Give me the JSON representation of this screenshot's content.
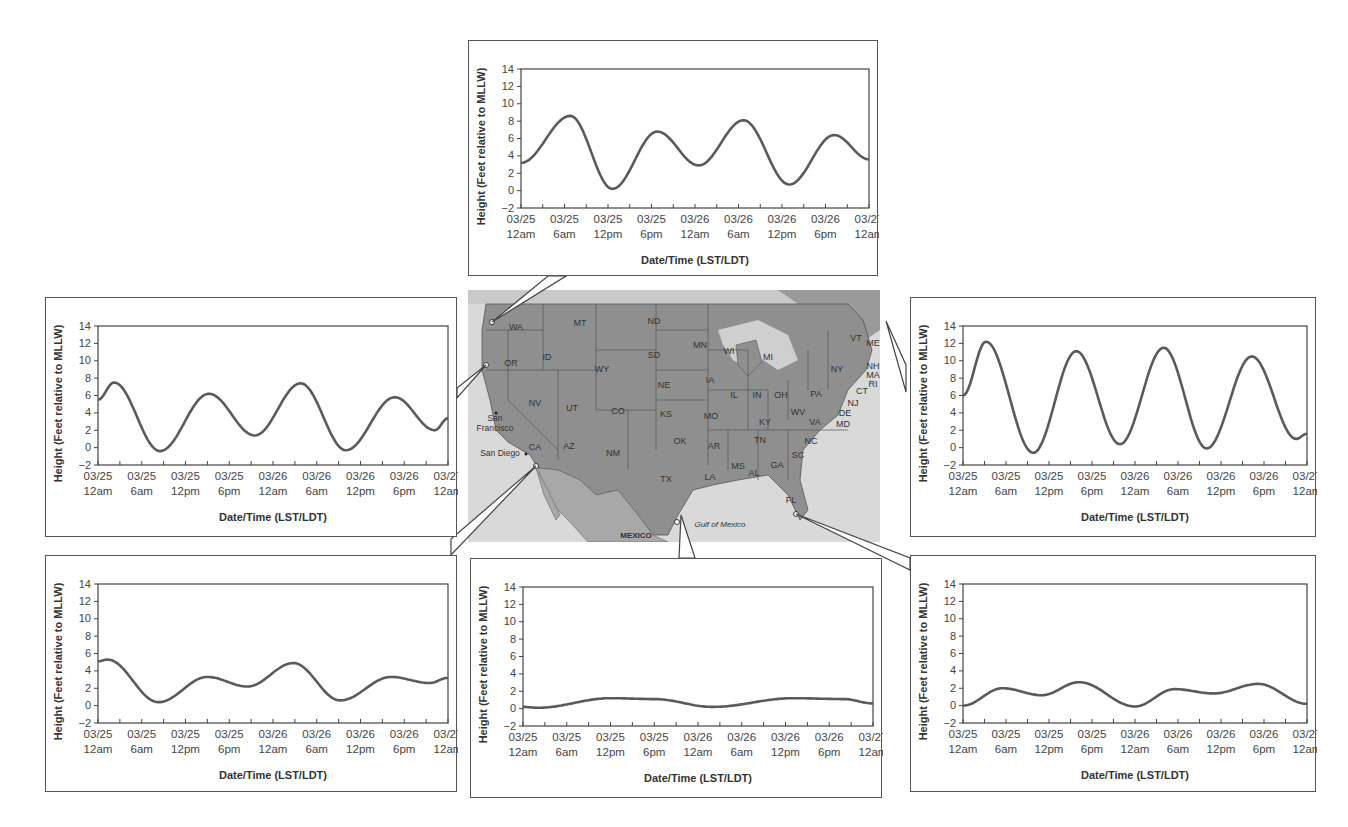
{
  "axis": {
    "ylabel": "Height (Feet relative to MLLW)",
    "xlabel": "Date/Time (LST/LDT)",
    "yticks": [
      14,
      12,
      10,
      8,
      6,
      4,
      2,
      0,
      -2
    ],
    "xticks_top": [
      "03/25",
      "03/25",
      "03/25",
      "03/25",
      "03/26",
      "03/26",
      "03/26",
      "03/26",
      "03/27"
    ],
    "xticks_bottom": [
      "12am",
      "6am",
      "12pm",
      "6pm",
      "12am",
      "6am",
      "12pm",
      "6pm",
      "12am"
    ]
  },
  "map": {
    "labels": {
      "WA": "WA",
      "OR": "OR",
      "ID": "ID",
      "MT": "MT",
      "ND": "ND",
      "SD": "SD",
      "WY": "WY",
      "NE": "NE",
      "NV": "NV",
      "UT": "UT",
      "CO": "CO",
      "KS": "KS",
      "CA": "CA",
      "AZ": "AZ",
      "NM": "NM",
      "OK": "OK",
      "TX": "TX",
      "MN": "MN",
      "IA": "IA",
      "MO": "MO",
      "AR": "AR",
      "LA": "LA",
      "WI": "WI",
      "IL": "IL",
      "MI": "MI",
      "IN": "IN",
      "OH": "OH",
      "KY": "KY",
      "TN": "TN",
      "MS": "MS",
      "AL": "AL",
      "GA": "GA",
      "FL": "FL",
      "SC": "SC",
      "NC": "NC",
      "VA": "VA",
      "WV": "WV",
      "PA": "PA",
      "NY": "NY",
      "VT": "VT",
      "ME": "ME",
      "NH": "NH",
      "MA": "MA",
      "RI": "RI",
      "CT": "CT",
      "NJ": "NJ",
      "DE": "DE",
      "MD": "MD"
    },
    "cities": {
      "san_francisco_1": "San",
      "san_francisco_2": "Francisco",
      "san_diego": "San Diego"
    },
    "water": {
      "gulf": "Gulf of Mexico"
    },
    "country": {
      "mexico": "MEXICO"
    }
  },
  "chart_data": [
    {
      "id": "top-center",
      "location": "Washington coast (Pacific NW)",
      "type": "line",
      "title": "",
      "xlabel": "Date/Time (LST/LDT)",
      "ylabel": "Height (Feet relative to MLLW)",
      "ylim": [
        -2,
        14
      ],
      "x_hours": [
        0,
        7,
        13,
        19,
        24.5,
        30.5,
        37,
        43,
        48
      ],
      "extrema_hours": [
        0,
        6.8,
        12.6,
        18.8,
        24.5,
        30.7,
        37.0,
        43.2,
        48
      ],
      "values": [
        3.2,
        8.6,
        0.2,
        6.8,
        2.9,
        8.1,
        0.7,
        6.4,
        3.6
      ]
    },
    {
      "id": "left",
      "location": "Northern California coast",
      "type": "line",
      "title": "",
      "xlabel": "Date/Time (LST/LDT)",
      "ylabel": "Height (Feet relative to MLLW)",
      "ylim": [
        -2,
        14
      ],
      "extrema_hours": [
        0,
        2.2,
        8.5,
        15.2,
        21.5,
        27.8,
        34.0,
        40.7,
        46.2,
        48
      ],
      "values": [
        5.5,
        7.5,
        -0.4,
        6.2,
        1.4,
        7.4,
        -0.3,
        5.8,
        2.0,
        3.4
      ]
    },
    {
      "id": "right",
      "location": "Maine coast (Northeast)",
      "type": "line",
      "title": "",
      "xlabel": "Date/Time (LST/LDT)",
      "ylabel": "Height (Feet relative to MLLW)",
      "ylim": [
        -2,
        14
      ],
      "extrema_hours": [
        0,
        3.2,
        9.8,
        15.8,
        21.9,
        28.0,
        34.0,
        40.3,
        46.5,
        48
      ],
      "values": [
        6.0,
        12.2,
        -0.6,
        11.1,
        0.4,
        11.5,
        -0.1,
        10.5,
        1.0,
        1.6
      ]
    },
    {
      "id": "bottom-left",
      "location": "San Diego, CA",
      "type": "line",
      "title": "",
      "xlabel": "Date/Time (LST/LDT)",
      "ylabel": "Height (Feet relative to MLLW)",
      "ylim": [
        -2,
        14
      ],
      "extrema_hours": [
        0,
        1.3,
        8.3,
        15.0,
        20.5,
        26.8,
        33.2,
        40.2,
        45.5,
        48
      ],
      "values": [
        5.1,
        5.3,
        0.4,
        3.3,
        2.2,
        4.9,
        0.6,
        3.3,
        2.6,
        3.2
      ]
    },
    {
      "id": "bottom-center",
      "location": "South Texas (Gulf coast)",
      "type": "line",
      "title": "",
      "xlabel": "Date/Time (LST/LDT)",
      "ylabel": "Height (Feet relative to MLLW)",
      "ylim": [
        -2,
        14
      ],
      "extrema_hours": [
        0,
        2.0,
        12.0,
        18.0,
        26.0,
        37.0,
        44.0,
        48
      ],
      "values": [
        0.2,
        0.1,
        1.2,
        1.1,
        0.2,
        1.2,
        1.1,
        0.6
      ]
    },
    {
      "id": "bottom-right",
      "location": "Southwest Florida (Gulf coast)",
      "type": "line",
      "title": "",
      "xlabel": "Date/Time (LST/LDT)",
      "ylabel": "Height (Feet relative to MLLW)",
      "ylim": [
        -2,
        14
      ],
      "extrema_hours": [
        0,
        5.5,
        11.0,
        16.2,
        24.0,
        29.5,
        35.0,
        41.2,
        48
      ],
      "values": [
        0.0,
        2.0,
        1.2,
        2.7,
        -0.1,
        1.9,
        1.4,
        2.5,
        0.2
      ]
    }
  ]
}
